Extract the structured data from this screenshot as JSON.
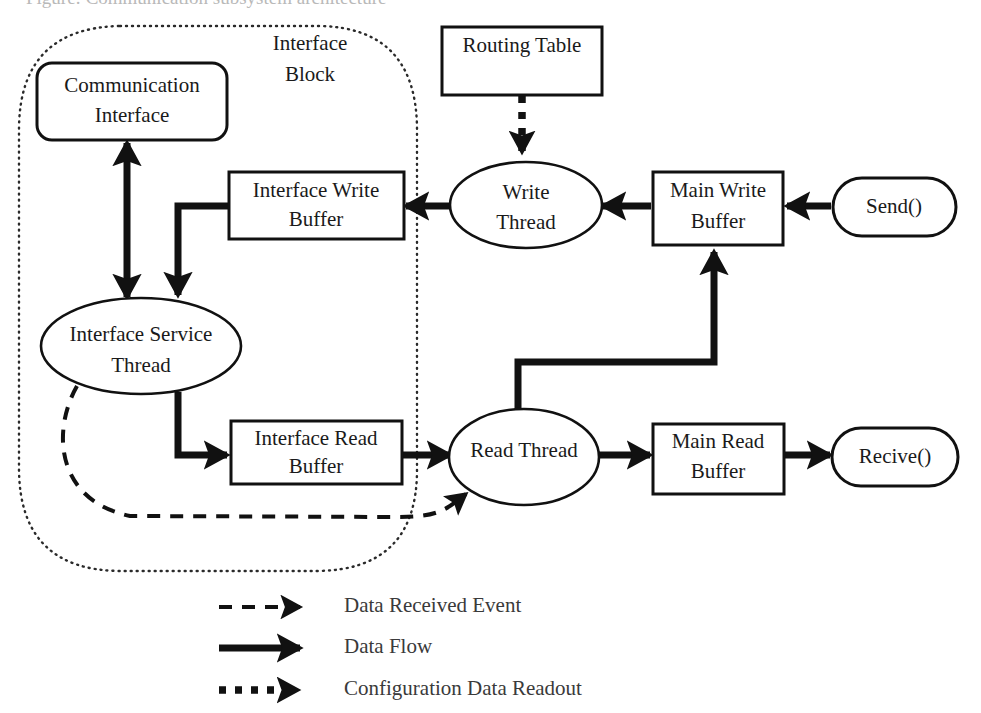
{
  "figure": {
    "cut_caption": "Figure: Communication subsystem architecture",
    "background_color": "#ffffff",
    "stroke_color": "#111111"
  },
  "block": {
    "boundary_name": "Interface Block",
    "label_line1": "Interface",
    "label_line2": "Block",
    "border_style": "dotted"
  },
  "nodes": {
    "communication_interface": {
      "label_line1": "Communication",
      "label_line2": "Interface",
      "shape": "rounded-rect"
    },
    "interface_service_thread": {
      "label_line1": "Interface Service",
      "label_line2": "Thread",
      "shape": "ellipse"
    },
    "interface_write_buffer": {
      "label_line1": "Interface Write",
      "label_line2": "Buffer",
      "shape": "rect"
    },
    "interface_read_buffer": {
      "label_line1": "Interface Read",
      "label_line2": "Buffer",
      "shape": "rect"
    },
    "routing_table": {
      "label_line1": "Routing Table",
      "label_line2": "",
      "shape": "rect"
    },
    "write_thread": {
      "label_line1": "Write",
      "label_line2": "Thread",
      "shape": "ellipse"
    },
    "read_thread": {
      "label_line1": "Read Thread",
      "label_line2": "",
      "shape": "ellipse"
    },
    "main_write_buffer": {
      "label_line1": "Main Write",
      "label_line2": "Buffer",
      "shape": "rect"
    },
    "main_read_buffer": {
      "label_line1": "Main Read",
      "label_line2": "Buffer",
      "shape": "rect"
    },
    "send_api": {
      "label_line1": "Send()",
      "label_line2": "",
      "shape": "stadium"
    },
    "receive_api": {
      "label_line1": "Recive()",
      "label_line2": "",
      "shape": "stadium"
    }
  },
  "legend": {
    "items": [
      {
        "style": "dashed",
        "label": "Data Received Event"
      },
      {
        "style": "solid",
        "label": "Data Flow"
      },
      {
        "style": "dotted-thick",
        "label": "Configuration Data Readout"
      }
    ]
  },
  "edges": [
    {
      "from": "communication_interface",
      "to": "interface_service_thread",
      "style": "solid",
      "bidirectional": true
    },
    {
      "from": "interface_write_buffer",
      "to": "interface_service_thread",
      "style": "solid",
      "bidirectional": false
    },
    {
      "from": "write_thread",
      "to": "interface_write_buffer",
      "style": "solid",
      "bidirectional": false
    },
    {
      "from": "routing_table",
      "to": "write_thread",
      "style": "dotted-thick",
      "bidirectional": false
    },
    {
      "from": "main_write_buffer",
      "to": "write_thread",
      "style": "solid",
      "bidirectional": false
    },
    {
      "from": "send_api",
      "to": "main_write_buffer",
      "style": "solid",
      "bidirectional": false
    },
    {
      "from": "interface_service_thread",
      "to": "interface_read_buffer",
      "style": "solid",
      "bidirectional": false
    },
    {
      "from": "interface_read_buffer",
      "to": "read_thread",
      "style": "solid",
      "bidirectional": false
    },
    {
      "from": "read_thread",
      "to": "main_write_buffer",
      "style": "solid",
      "bidirectional": false
    },
    {
      "from": "read_thread",
      "to": "main_read_buffer",
      "style": "solid",
      "bidirectional": false
    },
    {
      "from": "main_read_buffer",
      "to": "receive_api",
      "style": "solid",
      "bidirectional": false
    },
    {
      "from": "interface_service_thread",
      "to": "read_thread",
      "style": "dashed",
      "bidirectional": false
    }
  ]
}
